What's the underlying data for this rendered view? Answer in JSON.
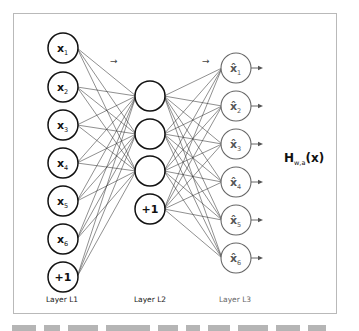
{
  "diagram": {
    "type": "autoencoder-network",
    "layers": [
      {
        "label": "Layer L1",
        "nodes": [
          {
            "var": "x",
            "sub": "1"
          },
          {
            "var": "x",
            "sub": "2"
          },
          {
            "var": "x",
            "sub": "3"
          },
          {
            "var": "x",
            "sub": "4"
          },
          {
            "var": "x",
            "sub": "5"
          },
          {
            "var": "x",
            "sub": "6"
          },
          {
            "var": "+1",
            "sub": ""
          }
        ]
      },
      {
        "label": "Layer L2",
        "nodes": [
          {
            "var": "",
            "sub": ""
          },
          {
            "var": "",
            "sub": ""
          },
          {
            "var": "",
            "sub": ""
          },
          {
            "var": "+1",
            "sub": ""
          }
        ]
      },
      {
        "label": "Layer L3",
        "nodes": [
          {
            "var": "x̂",
            "sub": "1"
          },
          {
            "var": "x̂",
            "sub": "2"
          },
          {
            "var": "x̂",
            "sub": "3"
          },
          {
            "var": "x̂",
            "sub": "4"
          },
          {
            "var": "x̂",
            "sub": "5"
          },
          {
            "var": "x̂",
            "sub": "6"
          }
        ]
      }
    ],
    "output_label": {
      "main": "H",
      "sub": "w,a",
      "arg": "(x)"
    },
    "flow_arrows": [
      "→",
      "→"
    ],
    "colors": {
      "frame": "#b9b9b9",
      "l1_node": "#111111",
      "l3_node": "#666666",
      "edge": "#333333"
    }
  }
}
